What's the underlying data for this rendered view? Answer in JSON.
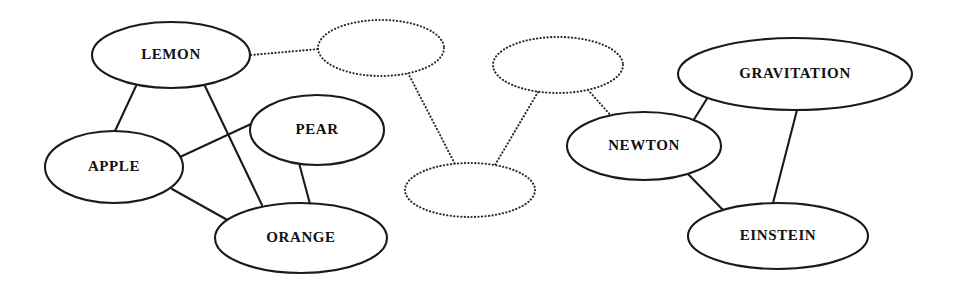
{
  "diagram": {
    "background_color": "#ffffff",
    "stroke_color": "#1a1a1a",
    "dotted_stroke_color": "#2b2b2b",
    "label_color": "#111111",
    "clusters": [
      {
        "id": "fruits",
        "name": "fruit-cluster",
        "style": "solid"
      },
      {
        "id": "unknown",
        "name": "unlabeled-cluster",
        "style": "dotted"
      },
      {
        "id": "physics",
        "name": "physics-cluster",
        "style": "solid"
      }
    ],
    "nodes": [
      {
        "id": "lemon",
        "label": "LEMON",
        "cx": 171,
        "cy": 55,
        "rx": 79,
        "ry": 33,
        "style": "solid",
        "font_size": 15,
        "cluster": "fruits"
      },
      {
        "id": "apple",
        "label": "APPLE",
        "cx": 114,
        "cy": 167,
        "rx": 69,
        "ry": 36,
        "style": "solid",
        "font_size": 15,
        "cluster": "fruits"
      },
      {
        "id": "pear",
        "label": "PEAR",
        "cx": 317,
        "cy": 130,
        "rx": 67,
        "ry": 35,
        "style": "solid",
        "font_size": 15,
        "cluster": "fruits"
      },
      {
        "id": "orange",
        "label": "ORANGE",
        "cx": 301,
        "cy": 238,
        "rx": 86,
        "ry": 35,
        "style": "solid",
        "font_size": 15,
        "cluster": "fruits"
      },
      {
        "id": "unknown1",
        "label": "",
        "cx": 381,
        "cy": 48,
        "rx": 63,
        "ry": 28,
        "style": "dotted",
        "font_size": 15,
        "cluster": "unknown"
      },
      {
        "id": "unknown2",
        "label": "",
        "cx": 558,
        "cy": 65,
        "rx": 65,
        "ry": 28,
        "style": "dotted",
        "font_size": 15,
        "cluster": "unknown"
      },
      {
        "id": "unknown3",
        "label": "",
        "cx": 470,
        "cy": 190,
        "rx": 65,
        "ry": 27,
        "style": "dotted",
        "font_size": 15,
        "cluster": "unknown"
      },
      {
        "id": "newton",
        "label": "NEWTON",
        "cx": 644,
        "cy": 146,
        "rx": 77,
        "ry": 34,
        "style": "solid",
        "font_size": 15,
        "cluster": "physics"
      },
      {
        "id": "gravitation",
        "label": "GRAVITATION",
        "cx": 795,
        "cy": 74,
        "rx": 117,
        "ry": 36,
        "style": "solid",
        "font_size": 15,
        "cluster": "physics"
      },
      {
        "id": "einstein",
        "label": "EINSTEIN",
        "cx": 778,
        "cy": 236,
        "rx": 90,
        "ry": 33,
        "style": "solid",
        "font_size": 15,
        "cluster": "physics"
      }
    ],
    "edges": [
      {
        "id": "lemon-apple",
        "source": "lemon",
        "target": "apple",
        "style": "solid",
        "x1": 136,
        "y1": 86,
        "x2": 115,
        "y2": 131
      },
      {
        "id": "lemon-orange",
        "source": "lemon",
        "target": "orange",
        "style": "solid",
        "x1": 204,
        "y1": 84,
        "x2": 262,
        "y2": 205
      },
      {
        "id": "apple-pear",
        "source": "apple",
        "target": "pear",
        "style": "solid",
        "x1": 180,
        "y1": 157,
        "x2": 251,
        "y2": 124
      },
      {
        "id": "apple-orange",
        "source": "apple",
        "target": "orange",
        "style": "solid",
        "x1": 172,
        "y1": 189,
        "x2": 231,
        "y2": 222
      },
      {
        "id": "pear-orange",
        "source": "pear",
        "target": "orange",
        "style": "solid",
        "x1": 299,
        "y1": 163,
        "x2": 310,
        "y2": 204
      },
      {
        "id": "lemon-unknown1",
        "source": "lemon",
        "target": "unknown1",
        "style": "dotted",
        "x1": 251,
        "y1": 55,
        "x2": 319,
        "y2": 49
      },
      {
        "id": "unknown1-unknown3",
        "source": "unknown1",
        "target": "unknown3",
        "style": "dotted",
        "x1": 408,
        "y1": 73,
        "x2": 455,
        "y2": 164
      },
      {
        "id": "unknown2-unknown3",
        "source": "unknown2",
        "target": "unknown3",
        "style": "dotted",
        "x1": 538,
        "y1": 92,
        "x2": 495,
        "y2": 165
      },
      {
        "id": "unknown2-newton",
        "source": "unknown2",
        "target": "newton",
        "style": "dotted",
        "x1": 588,
        "y1": 90,
        "x2": 614,
        "y2": 119
      },
      {
        "id": "newton-gravitation",
        "source": "newton",
        "target": "gravitation",
        "style": "solid",
        "x1": 693,
        "y1": 121,
        "x2": 708,
        "y2": 97
      },
      {
        "id": "newton-einstein",
        "source": "newton",
        "target": "einstein",
        "style": "solid",
        "x1": 687,
        "y1": 173,
        "x2": 724,
        "y2": 211
      },
      {
        "id": "gravitation-einstein",
        "source": "gravitation",
        "target": "einstein",
        "style": "solid",
        "x1": 797,
        "y1": 110,
        "x2": 773,
        "y2": 203
      }
    ]
  }
}
